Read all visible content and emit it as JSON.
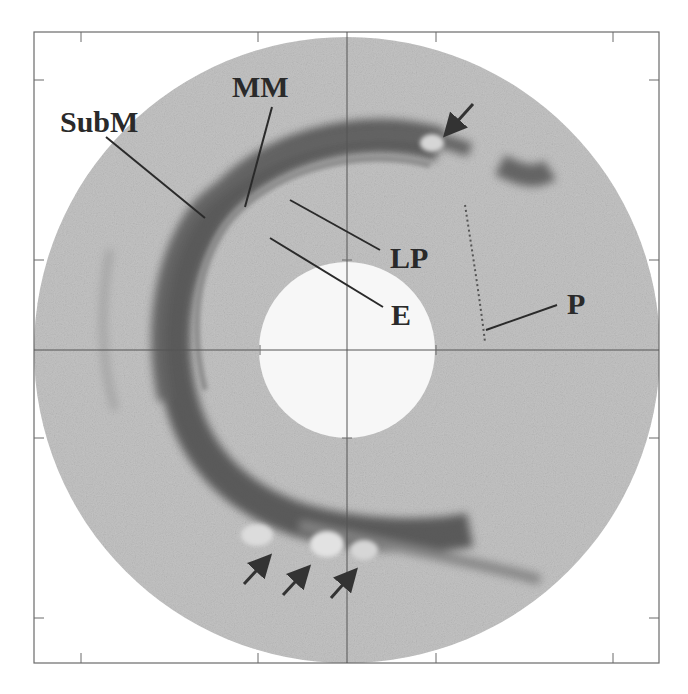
{
  "figure": {
    "kind": "intravascular cross-sectional image",
    "frame": {
      "left": 34,
      "top": 32,
      "right": 659,
      "bottom": 663
    },
    "center": {
      "x": 347,
      "y": 350
    },
    "outer_radius": 313,
    "inner_radius": 88,
    "colors": {
      "background": "#ffffff",
      "tissue": "#c4c4c4",
      "lumen": "#f7f7f7",
      "dark_band": "#3a3a3a",
      "frame": "#6a6a6a",
      "label": "#2a2a2a"
    },
    "x_ticks": [
      101,
      258,
      347,
      436,
      527,
      613
    ],
    "y_ticks": [
      81,
      260,
      350,
      438,
      528,
      616
    ]
  },
  "labels": [
    {
      "id": "submm",
      "text": "SubM",
      "x": 60,
      "y": 130
    },
    {
      "id": "mm",
      "text": "MM",
      "x": 232,
      "y": 96
    },
    {
      "id": "lp",
      "text": "LP",
      "x": 390,
      "y": 268
    },
    {
      "id": "e",
      "text": "E",
      "x": 391,
      "y": 315
    },
    {
      "id": "p",
      "text": "P",
      "x": 568,
      "y": 314
    }
  ],
  "arrows_count": 4
}
